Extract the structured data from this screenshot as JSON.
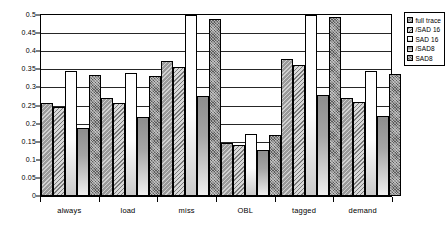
{
  "chart_data": {
    "type": "bar",
    "title": "",
    "xlabel": "",
    "ylabel": "",
    "ylim": [
      0,
      0.5
    ],
    "ytick_step": 0.05,
    "grid": true,
    "legend_position": "top-right",
    "categories": [
      "always",
      "load",
      "miss",
      "OBL",
      "tagged",
      "demand"
    ],
    "ytick_labels": [
      "0.5",
      "0.45",
      "0.4",
      "0.35",
      "0.3",
      "0.25",
      "0.2",
      "0.15",
      "0.1",
      "0.05",
      "0"
    ],
    "series": [
      {
        "name": "full trace",
        "values": [
          0.257,
          0.27,
          0.373,
          0.146,
          0.379,
          0.272
        ]
      },
      {
        "name": "/SAD 16",
        "values": [
          0.247,
          0.258,
          0.356,
          0.142,
          0.362,
          0.261
        ]
      },
      {
        "name": "SAD 16",
        "values": [
          0.345,
          0.34,
          0.502,
          0.17,
          0.503,
          0.344
        ]
      },
      {
        "name": "/SAD8",
        "values": [
          0.188,
          0.217,
          0.277,
          0.126,
          0.279,
          0.22
        ]
      },
      {
        "name": "SAD8",
        "values": [
          0.335,
          0.332,
          0.489,
          0.168,
          0.495,
          0.336
        ]
      }
    ]
  },
  "legend": {
    "items": [
      {
        "label": "full trace"
      },
      {
        "label": "/SAD 16"
      },
      {
        "label": "SAD 16"
      },
      {
        "label": "/SAD8"
      },
      {
        "label": "SAD8"
      }
    ]
  }
}
